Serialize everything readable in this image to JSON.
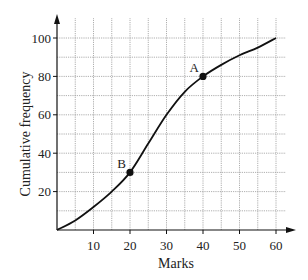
{
  "chart_data": {
    "type": "line",
    "title": "",
    "xlabel": "Marks",
    "ylabel": "Cumulative frequency",
    "xlim": [
      0,
      60
    ],
    "ylim": [
      0,
      100
    ],
    "x_ticks": [
      10,
      20,
      30,
      40,
      50,
      60
    ],
    "y_ticks": [
      20,
      40,
      60,
      80,
      100
    ],
    "grid": true,
    "grid_x_step": 5,
    "grid_y_step": 10,
    "legend": null,
    "series": [
      {
        "name": "Cumulative frequency curve",
        "x": [
          0,
          5,
          10,
          15,
          20,
          25,
          30,
          35,
          40,
          45,
          50,
          55,
          60
        ],
        "y": [
          0,
          5,
          12,
          20,
          30,
          45,
          60,
          72,
          80,
          86,
          91,
          95,
          100
        ]
      }
    ],
    "annotations": [
      {
        "label": "A",
        "x": 40,
        "y": 80
      },
      {
        "label": "B",
        "x": 20,
        "y": 30
      }
    ]
  },
  "colors": {
    "curve": "#111111",
    "grid": "#9a9a9a",
    "axis": "#111111"
  }
}
